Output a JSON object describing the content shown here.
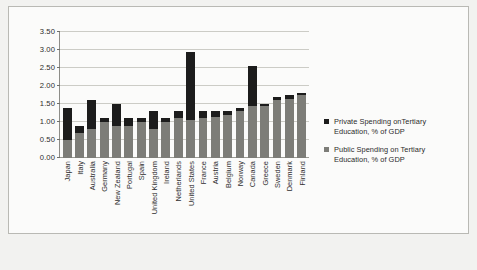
{
  "chart_data": {
    "type": "bar",
    "stacked": true,
    "title": "",
    "xlabel": "",
    "ylabel": "",
    "ylim": [
      0.0,
      3.5
    ],
    "ytick_labels": [
      "3.50",
      "3.00",
      "2.50",
      "2.00",
      "1.50",
      "1.00",
      "0.50",
      "0.00"
    ],
    "ytick_values": [
      3.5,
      3.0,
      2.5,
      2.0,
      1.5,
      1.0,
      0.5,
      0.0
    ],
    "grid": true,
    "legend_position": "right",
    "categories": [
      "Japan",
      "Italy",
      "Australia",
      "Germany",
      "New Zealand",
      "Portugal",
      "Spain",
      "United Kingdom",
      "Ireland",
      "Netherlands",
      "United States",
      "France",
      "Austria",
      "Belgium",
      "Norway",
      "Canada",
      "Greece",
      "Sweden",
      "Denmark",
      "Finland"
    ],
    "series": [
      {
        "name": "Public Spending on Tertiary Education, % of GDP",
        "color": "#7d7d78",
        "values": [
          0.5,
          0.7,
          0.8,
          1.0,
          0.9,
          0.9,
          1.0,
          0.8,
          1.0,
          1.1,
          1.05,
          1.1,
          1.15,
          1.2,
          1.3,
          1.45,
          1.45,
          1.6,
          1.65,
          1.75
        ]
      },
      {
        "name": "Private Spending onTertiary Education, % of GDP",
        "color": "#1c1c1c",
        "values": [
          0.9,
          0.2,
          0.8,
          0.1,
          0.6,
          0.2,
          0.1,
          0.5,
          0.1,
          0.2,
          1.9,
          0.2,
          0.15,
          0.1,
          0.1,
          1.1,
          0.05,
          0.1,
          0.1,
          0.05
        ]
      }
    ],
    "totals": [
      1.4,
      0.9,
      1.6,
      1.1,
      1.5,
      1.1,
      1.1,
      1.3,
      1.1,
      1.3,
      2.95,
      1.3,
      1.3,
      1.3,
      1.4,
      2.55,
      1.5,
      1.7,
      1.75,
      1.8
    ]
  },
  "legend": {
    "items": [
      {
        "swatch": "private",
        "line1": "Private Spending onTertiary",
        "line2": "Education, % of GDP"
      },
      {
        "swatch": "public",
        "line1": "Public Spending on Tertiary",
        "line2": "Education, % of GDP"
      }
    ]
  },
  "caption": ""
}
